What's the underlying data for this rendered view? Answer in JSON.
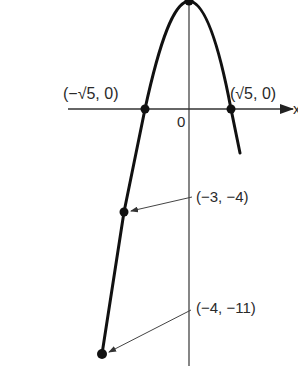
{
  "figure": {
    "type": "parabola-graph",
    "equation_implied": "y = 5 - x^2",
    "axes": {
      "x_label": "x",
      "origin_label": "0"
    },
    "points": [
      {
        "name": "vertex",
        "label": "(0, 5)",
        "x": 0,
        "y": 5,
        "label_visible": false
      },
      {
        "name": "left-root",
        "label": "(−√5, 0)",
        "x": -2.236,
        "y": 0
      },
      {
        "name": "right-root",
        "label": "(√5, 0)",
        "x": 2.236,
        "y": 0
      },
      {
        "name": "point-minus3",
        "label": "(−3, −4)",
        "x": -3,
        "y": -4
      },
      {
        "name": "point-minus4",
        "label": "(−4, −11)",
        "x": -4,
        "y": -11
      }
    ],
    "colors": {
      "curve": "#111111",
      "axis": "#333333",
      "text": "#2a2a2a"
    }
  }
}
